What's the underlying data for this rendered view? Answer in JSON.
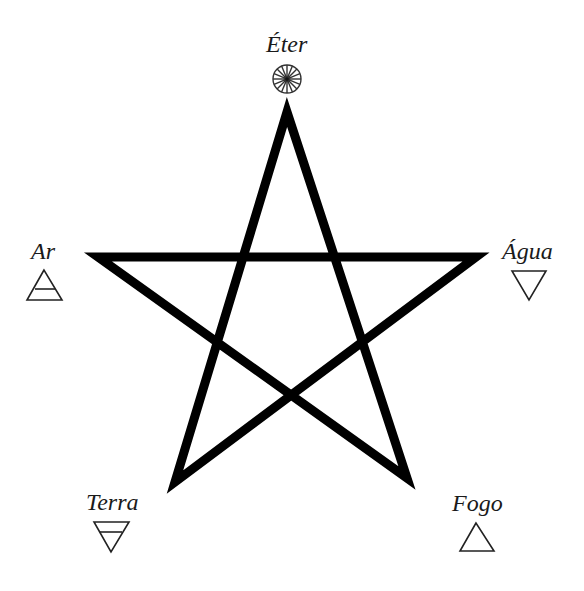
{
  "diagram": {
    "colors": {
      "stroke": "#000000",
      "symbol": "#222222",
      "text": "#1a1a1a",
      "background": "#ffffff"
    },
    "star": {
      "vertices": [
        {
          "name": "top",
          "x": 287,
          "y": 112
        },
        {
          "name": "bottom-right",
          "x": 407,
          "y": 478
        },
        {
          "name": "left",
          "x": 98,
          "y": 257
        },
        {
          "name": "right",
          "x": 476,
          "y": 257
        },
        {
          "name": "bottom-left",
          "x": 175,
          "y": 482
        }
      ],
      "stroke_width": 9
    },
    "elements": [
      {
        "id": "eter",
        "label": "Éter",
        "symbol": "wheel-circle-icon",
        "position": "top"
      },
      {
        "id": "ar",
        "label": "Ar",
        "symbol": "triangle-up-with-bar-icon",
        "position": "left"
      },
      {
        "id": "agua",
        "label": "Água",
        "symbol": "triangle-down-icon",
        "position": "right"
      },
      {
        "id": "terra",
        "label": "Terra",
        "symbol": "triangle-down-with-bar-icon",
        "position": "bottom-left"
      },
      {
        "id": "fogo",
        "label": "Fogo",
        "symbol": "triangle-up-icon",
        "position": "bottom-right"
      }
    ]
  }
}
